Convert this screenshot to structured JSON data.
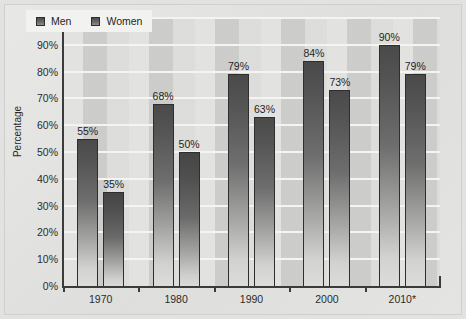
{
  "chart_data": {
    "type": "bar",
    "title": "",
    "xlabel": "",
    "ylabel": "Percentage",
    "categories": [
      "1970",
      "1980",
      "1990",
      "2000",
      "2010*"
    ],
    "series": [
      {
        "name": "Men",
        "values": [
          55,
          68,
          79,
          84,
          90
        ],
        "labels": [
          "55%",
          "68%",
          "79%",
          "84%",
          "90%"
        ],
        "color": "#4a4a4a"
      },
      {
        "name": "Women",
        "values": [
          35,
          50,
          63,
          73,
          79
        ],
        "labels": [
          "35%",
          "50%",
          "63%",
          "73%",
          "79%"
        ],
        "color": "#4a4a4a"
      }
    ],
    "ylim": [
      0,
      100
    ],
    "ytick_values": [
      0,
      10,
      20,
      30,
      40,
      50,
      60,
      70,
      80,
      90,
      100
    ],
    "ytick_labels": [
      "0%",
      "10%",
      "20%",
      "30%",
      "40%",
      "50%",
      "60%",
      "70%",
      "80%",
      "90%",
      "100%"
    ],
    "grid": "horizontal",
    "legend_position": "top-left",
    "legend_entries": [
      "Men",
      "Women"
    ]
  },
  "axis": {
    "y_title": "Percentage"
  },
  "legend": {
    "men_label": "Men",
    "women_label": "Women"
  }
}
